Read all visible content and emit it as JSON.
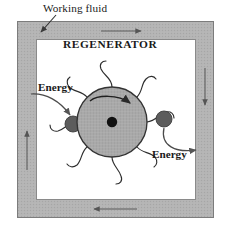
{
  "figure": {
    "kind": "rotary-regenerator-schematic",
    "labels": {
      "working_fluid": "Working fluid",
      "regenerator": "REGENERATOR",
      "energy_in": "Energy",
      "energy_out": "Energy"
    },
    "colors": {
      "duct_fill": "#b3b3b3",
      "duct_stroke": "#7a7a7a",
      "inner_fill": "#ffffff",
      "wheel_fill": "#a8a8a8",
      "wheel_stroke": "#3a3a3a",
      "hub_fill": "#101010",
      "port_fill": "#5c5c5c",
      "arrow_stroke": "#555555",
      "leader_stroke": "#3a3a3a",
      "text": "#1a1a1a"
    },
    "duct": {
      "outer": {
        "x": 17,
        "y": 21,
        "width": 197,
        "height": 197
      },
      "inner": {
        "x": 36,
        "y": 39,
        "width": 160,
        "height": 161
      },
      "band_thickness": 19
    },
    "wheel": {
      "center_x": 112,
      "center_y": 122,
      "radius": 35,
      "hub_radius": 5,
      "rotation_direction": "clockwise",
      "blade_count": 8
    },
    "ports": [
      {
        "name": "energy-in-port",
        "cx": 73,
        "cy": 124,
        "r": 8
      },
      {
        "name": "energy-out-port",
        "cx": 164,
        "cy": 119,
        "r": 8
      }
    ],
    "flow_arrows": [
      {
        "name": "duct-arrow-top",
        "direction": "right"
      },
      {
        "name": "duct-arrow-right",
        "direction": "down"
      },
      {
        "name": "duct-arrow-bottom",
        "direction": "left"
      },
      {
        "name": "duct-arrow-left",
        "direction": "up"
      }
    ]
  }
}
